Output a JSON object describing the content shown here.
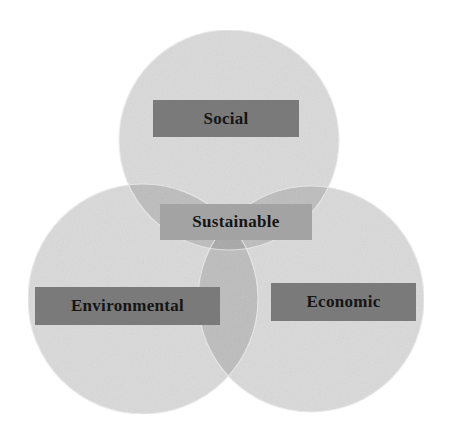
{
  "diagram": {
    "type": "venn",
    "circles": [
      {
        "name": "Social",
        "cx": 229,
        "cy": 140,
        "r": 110
      },
      {
        "name": "Environmental",
        "cx": 143,
        "cy": 299,
        "r": 115
      },
      {
        "name": "Economic",
        "cx": 311,
        "cy": 299,
        "r": 113
      }
    ],
    "labels": {
      "social": "Social",
      "environmental": "Environmental",
      "economic": "Economic",
      "center": "Sustainable"
    },
    "colors": {
      "circle_fill": "#d9d9d9",
      "overlap_fill": "#b9b9b9",
      "label_box": "#7a7a7a",
      "center_box": "#a3a3a3",
      "text": "#151515"
    }
  }
}
